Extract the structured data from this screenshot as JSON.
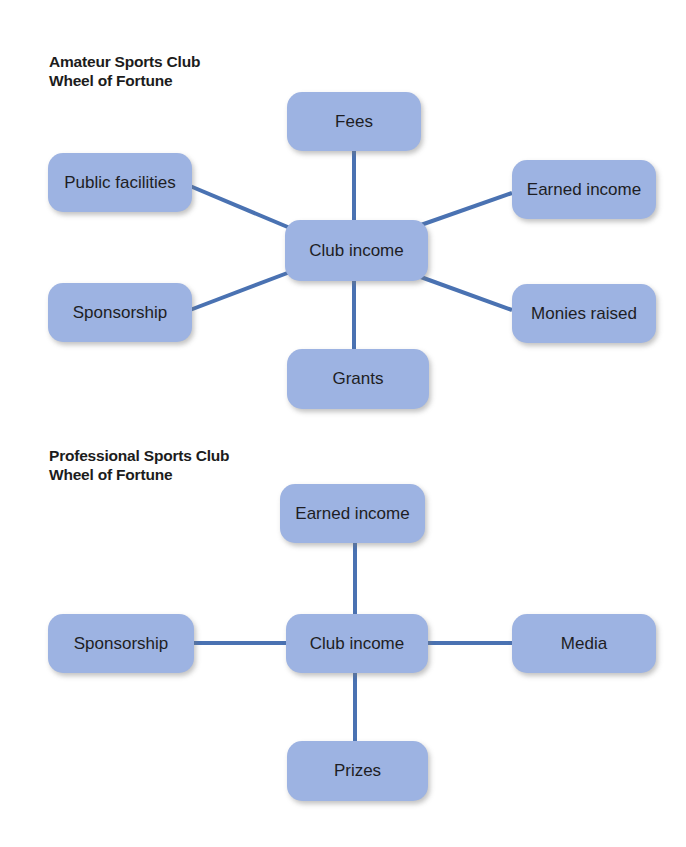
{
  "colors": {
    "node_fill": "#9db3e2",
    "connector": "#4a72b2",
    "text": "#1e1e24",
    "background": "#ffffff"
  },
  "diagrams": [
    {
      "title_line1": "Amateur Sports Club",
      "title_line2": "Wheel of Fortune",
      "center": "Club income",
      "nodes": {
        "top": "Fees",
        "upper_left": "Public facilities",
        "upper_right": "Earned income",
        "lower_left": "Sponsorship",
        "lower_right": "Monies raised",
        "bottom": "Grants"
      }
    },
    {
      "title_line1": "Professional Sports Club",
      "title_line2": "Wheel of Fortune",
      "center": "Club income",
      "nodes": {
        "top": "Earned income",
        "left": "Sponsorship",
        "right": "Media",
        "bottom": "Prizes"
      }
    }
  ]
}
